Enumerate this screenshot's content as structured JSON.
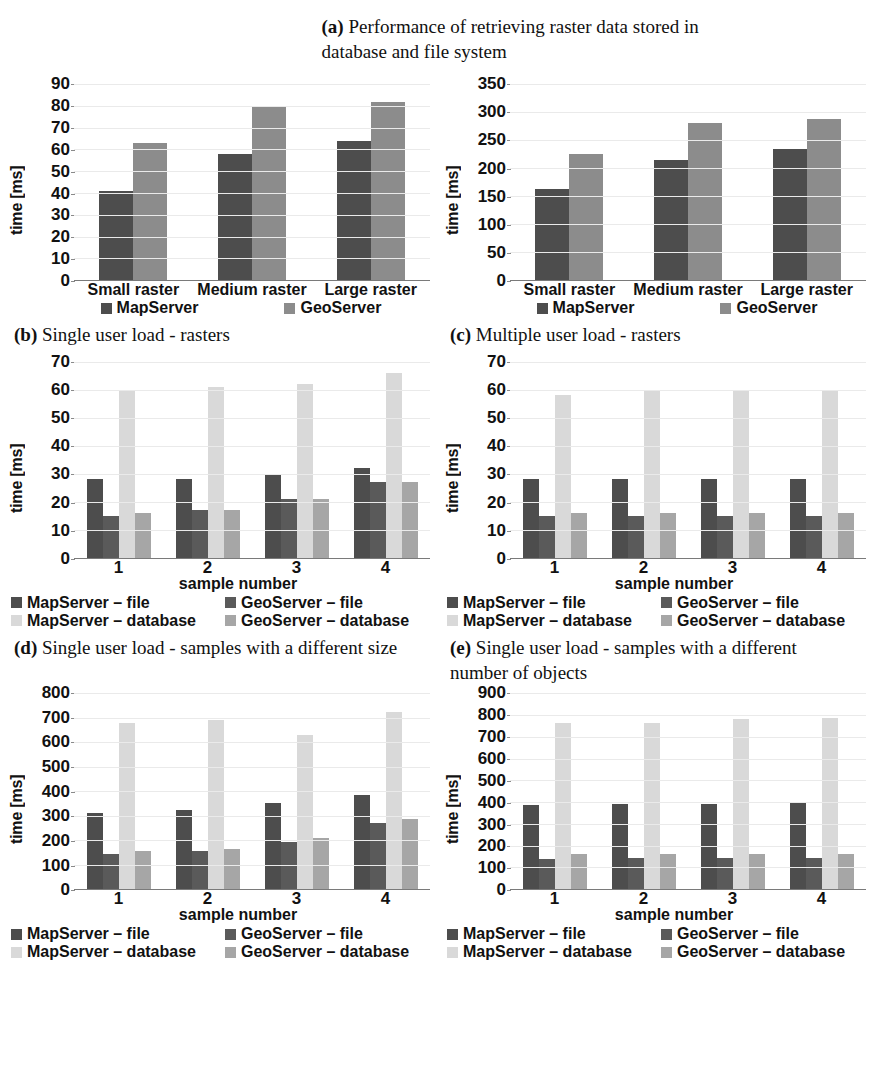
{
  "figure": {
    "main_caption_tag": "(a)",
    "main_caption_text": "Performance of retrieving raster data stored in database and file system"
  },
  "colors": {
    "dark": "#4d4d4d",
    "medium_dark": "#5a5a5a",
    "medium": "#8c8c8c",
    "light": "#d9d9d9",
    "mid_light": "#a6a6a6",
    "gridline": "#eaeaea",
    "axis": "#7a7a7a"
  },
  "panels": [
    {
      "id": "b",
      "caption_tag": "(b)",
      "caption_text": "Single user load - rasters",
      "legend_style": "single-row",
      "chart_data": {
        "type": "bar",
        "title": "Single user load - rasters",
        "xlabel": "",
        "ylabel": "time [ms]",
        "ylim": [
          0,
          90
        ],
        "yticks": [
          0,
          10,
          20,
          30,
          40,
          50,
          60,
          70,
          80,
          90
        ],
        "grid": true,
        "legend_position": "bottom",
        "categories": [
          "Small raster",
          "Medium raster",
          "Large raster"
        ],
        "series": [
          {
            "name": "MapServer",
            "color": "#4d4d4d",
            "values": [
              41,
              58,
              64
            ]
          },
          {
            "name": "GeoServer",
            "color": "#8c8c8c",
            "values": [
              63,
              80,
              82
            ]
          }
        ]
      }
    },
    {
      "id": "c",
      "caption_tag": "(c)",
      "caption_text": "Multiple user load - rasters",
      "legend_style": "single-row",
      "chart_data": {
        "type": "bar",
        "title": "Multiple user load - rasters",
        "xlabel": "",
        "ylabel": "time [ms]",
        "ylim": [
          0,
          350
        ],
        "yticks": [
          0,
          50,
          100,
          150,
          200,
          250,
          300,
          350
        ],
        "grid": true,
        "legend_position": "bottom",
        "categories": [
          "Small raster",
          "Medium raster",
          "Large raster"
        ],
        "series": [
          {
            "name": "MapServer",
            "color": "#4d4d4d",
            "values": [
              162,
              215,
              234
            ]
          },
          {
            "name": "GeoServer",
            "color": "#8c8c8c",
            "values": [
              225,
              280,
              288
            ]
          }
        ]
      }
    },
    {
      "id": "d",
      "caption_tag": "(d)",
      "caption_text": "Single user load - samples with a different size",
      "legend_style": "two-by-two",
      "chart_data": {
        "type": "bar",
        "title": "Single user load - samples with a different size",
        "xlabel": "sample number",
        "ylabel": "time [ms]",
        "ylim": [
          0,
          70
        ],
        "yticks": [
          0,
          10,
          20,
          30,
          40,
          50,
          60,
          70
        ],
        "grid": true,
        "legend_position": "bottom",
        "categories": [
          "1",
          "2",
          "3",
          "4"
        ],
        "series": [
          {
            "name": "MapServer – file",
            "color": "#4d4d4d",
            "values": [
              28,
              28,
              30,
              32
            ]
          },
          {
            "name": "GeoServer – file",
            "color": "#5a5a5a",
            "values": [
              15,
              17,
              21,
              27
            ]
          },
          {
            "name": "MapServer – database",
            "color": "#d9d9d9",
            "values": [
              60,
              61,
              62,
              66
            ]
          },
          {
            "name": "GeoServer – database",
            "color": "#a6a6a6",
            "values": [
              16,
              17,
              21,
              27
            ]
          }
        ]
      }
    },
    {
      "id": "e",
      "caption_tag": "(e)",
      "caption_text": "Single user load - samples with a different number of objects",
      "legend_style": "two-by-two",
      "chart_data": {
        "type": "bar",
        "title": "Single user load - samples with a different number of objects",
        "xlabel": "sample number",
        "ylabel": "time [ms]",
        "ylim": [
          0,
          70
        ],
        "yticks": [
          0,
          10,
          20,
          30,
          40,
          50,
          60,
          70
        ],
        "grid": true,
        "legend_position": "bottom",
        "categories": [
          "1",
          "2",
          "3",
          "4"
        ],
        "series": [
          {
            "name": "MapServer – file",
            "color": "#4d4d4d",
            "values": [
              28,
              28,
              28,
              28
            ]
          },
          {
            "name": "GeoServer – file",
            "color": "#5a5a5a",
            "values": [
              15,
              15,
              15,
              15
            ]
          },
          {
            "name": "MapServer – database",
            "color": "#d9d9d9",
            "values": [
              58,
              60,
              60,
              60
            ]
          },
          {
            "name": "GeoServer – database",
            "color": "#a6a6a6",
            "values": [
              16,
              16,
              16,
              16
            ]
          }
        ]
      }
    },
    {
      "id": "f",
      "caption_tag": "(f)",
      "caption_text": "",
      "legend_style": "two-by-two",
      "chart_data": {
        "type": "bar",
        "title": "Multiple user load - samples with a different size",
        "xlabel": "sample number",
        "ylabel": "time [ms]",
        "ylim": [
          0,
          800
        ],
        "yticks": [
          0,
          100,
          200,
          300,
          400,
          500,
          600,
          700,
          800
        ],
        "grid": true,
        "legend_position": "bottom",
        "categories": [
          "1",
          "2",
          "3",
          "4"
        ],
        "series": [
          {
            "name": "MapServer – file",
            "color": "#4d4d4d",
            "values": [
              310,
              323,
              350,
              385
            ]
          },
          {
            "name": "GeoServer – file",
            "color": "#5a5a5a",
            "values": [
              145,
              155,
              193,
              272
            ]
          },
          {
            "name": "MapServer – database",
            "color": "#d9d9d9",
            "values": [
              680,
              692,
              630,
              723
            ]
          },
          {
            "name": "GeoServer – database",
            "color": "#a6a6a6",
            "values": [
              158,
              165,
              210,
              285
            ]
          }
        ]
      }
    },
    {
      "id": "g",
      "caption_tag": "(g)",
      "caption_text": "",
      "legend_style": "two-by-two",
      "chart_data": {
        "type": "bar",
        "title": "Multiple user load - samples with a different number of objects",
        "xlabel": "sample number",
        "ylabel": "time [ms]",
        "ylim": [
          0,
          900
        ],
        "yticks": [
          0,
          100,
          200,
          300,
          400,
          500,
          600,
          700,
          800,
          900
        ],
        "grid": true,
        "legend_position": "bottom",
        "categories": [
          "1",
          "2",
          "3",
          "4"
        ],
        "series": [
          {
            "name": "MapServer – file",
            "color": "#4d4d4d",
            "values": [
              385,
              390,
              390,
              395
            ]
          },
          {
            "name": "GeoServer – file",
            "color": "#5a5a5a",
            "values": [
              140,
              143,
              145,
              145
            ]
          },
          {
            "name": "MapServer – database",
            "color": "#d9d9d9",
            "values": [
              765,
              762,
              780,
              788
            ]
          },
          {
            "name": "GeoServer – database",
            "color": "#a6a6a6",
            "values": [
              163,
              162,
              163,
              163
            ]
          }
        ]
      }
    }
  ]
}
